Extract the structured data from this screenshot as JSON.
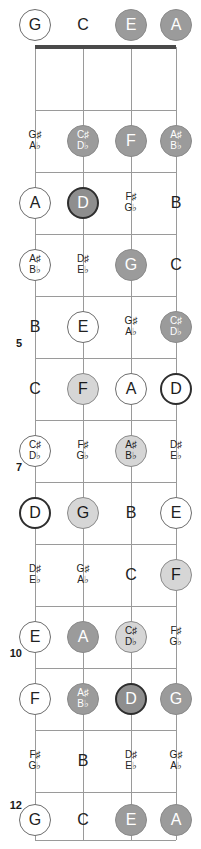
{
  "diagram": {
    "type": "fretboard",
    "instrument_strings": [
      "G",
      "C",
      "E",
      "A"
    ],
    "string_count": 4,
    "fret_count": 12,
    "string_x": [
      35,
      83,
      131,
      176
    ],
    "nut_y": 47,
    "fret_line_y": [
      47,
      110,
      172,
      234,
      296,
      358,
      420,
      482,
      544,
      606,
      668,
      730,
      792
    ],
    "open_row_y": 25,
    "note_row_y": [
      78,
      141,
      203,
      265,
      327,
      389,
      451,
      513,
      575,
      637,
      699,
      761,
      820
    ],
    "fret_numbers": [
      {
        "label": "5",
        "y": 344
      },
      {
        "label": "7",
        "y": 468
      },
      {
        "label": "10",
        "y": 654
      },
      {
        "label": "12",
        "y": 806
      }
    ],
    "notes": [
      {
        "fret": 0,
        "string": 0,
        "text": "G",
        "style": "open"
      },
      {
        "fret": 0,
        "string": 1,
        "text": "C",
        "style": "plain"
      },
      {
        "fret": 0,
        "string": 2,
        "text": "E",
        "style": "mid"
      },
      {
        "fret": 0,
        "string": 3,
        "text": "A",
        "style": "mid"
      },
      {
        "fret": 1,
        "string": 0,
        "sharp": "G♯",
        "flat": "A♭",
        "style": "plain"
      },
      {
        "fret": 1,
        "string": 1,
        "sharp": "C♯",
        "flat": "D♭",
        "style": "mid"
      },
      {
        "fret": 1,
        "string": 2,
        "text": "F",
        "style": "mid"
      },
      {
        "fret": 1,
        "string": 3,
        "sharp": "A♯",
        "flat": "B♭",
        "style": "mid"
      },
      {
        "fret": 2,
        "string": 0,
        "text": "A",
        "style": "open"
      },
      {
        "fret": 2,
        "string": 1,
        "text": "D",
        "style": "root-fill"
      },
      {
        "fret": 2,
        "string": 2,
        "sharp": "F♯",
        "flat": "G♭",
        "style": "plain"
      },
      {
        "fret": 2,
        "string": 3,
        "text": "B",
        "style": "plain"
      },
      {
        "fret": 3,
        "string": 0,
        "sharp": "A♯",
        "flat": "B♭",
        "style": "open"
      },
      {
        "fret": 3,
        "string": 1,
        "sharp": "D♯",
        "flat": "E♭",
        "style": "plain"
      },
      {
        "fret": 3,
        "string": 2,
        "text": "G",
        "style": "mid"
      },
      {
        "fret": 3,
        "string": 3,
        "text": "C",
        "style": "plain"
      },
      {
        "fret": 4,
        "string": 0,
        "text": "B",
        "style": "plain"
      },
      {
        "fret": 4,
        "string": 1,
        "text": "E",
        "style": "open"
      },
      {
        "fret": 4,
        "string": 2,
        "sharp": "G♯",
        "flat": "A♭",
        "style": "plain"
      },
      {
        "fret": 4,
        "string": 3,
        "sharp": "C♯",
        "flat": "D♭",
        "style": "mid"
      },
      {
        "fret": 5,
        "string": 0,
        "text": "C",
        "style": "plain"
      },
      {
        "fret": 5,
        "string": 1,
        "text": "F",
        "style": "light"
      },
      {
        "fret": 5,
        "string": 2,
        "text": "A",
        "style": "open"
      },
      {
        "fret": 5,
        "string": 3,
        "text": "D",
        "style": "root-hollow"
      },
      {
        "fret": 6,
        "string": 0,
        "sharp": "C♯",
        "flat": "D♭",
        "style": "open"
      },
      {
        "fret": 6,
        "string": 1,
        "sharp": "F♯",
        "flat": "G♭",
        "style": "plain"
      },
      {
        "fret": 6,
        "string": 2,
        "sharp": "A♯",
        "flat": "B♭",
        "style": "light"
      },
      {
        "fret": 6,
        "string": 3,
        "sharp": "D♯",
        "flat": "E♭",
        "style": "plain"
      },
      {
        "fret": 7,
        "string": 0,
        "text": "D",
        "style": "root-hollow"
      },
      {
        "fret": 7,
        "string": 1,
        "text": "G",
        "style": "light"
      },
      {
        "fret": 7,
        "string": 2,
        "text": "B",
        "style": "plain"
      },
      {
        "fret": 7,
        "string": 3,
        "text": "E",
        "style": "open"
      },
      {
        "fret": 8,
        "string": 0,
        "sharp": "D♯",
        "flat": "E♭",
        "style": "plain"
      },
      {
        "fret": 8,
        "string": 1,
        "sharp": "G♯",
        "flat": "A♭",
        "style": "plain"
      },
      {
        "fret": 8,
        "string": 2,
        "text": "C",
        "style": "plain"
      },
      {
        "fret": 8,
        "string": 3,
        "text": "F",
        "style": "light"
      },
      {
        "fret": 9,
        "string": 0,
        "text": "E",
        "style": "open"
      },
      {
        "fret": 9,
        "string": 1,
        "text": "A",
        "style": "mid"
      },
      {
        "fret": 9,
        "string": 2,
        "sharp": "C♯",
        "flat": "D♭",
        "style": "light"
      },
      {
        "fret": 9,
        "string": 3,
        "sharp": "F♯",
        "flat": "G♭",
        "style": "plain"
      },
      {
        "fret": 10,
        "string": 0,
        "text": "F",
        "style": "open"
      },
      {
        "fret": 10,
        "string": 1,
        "sharp": "A♯",
        "flat": "B♭",
        "style": "mid"
      },
      {
        "fret": 10,
        "string": 2,
        "text": "D",
        "style": "root-fill"
      },
      {
        "fret": 10,
        "string": 3,
        "text": "G",
        "style": "mid"
      },
      {
        "fret": 11,
        "string": 0,
        "sharp": "F♯",
        "flat": "G♭",
        "style": "plain"
      },
      {
        "fret": 11,
        "string": 1,
        "text": "B",
        "style": "plain"
      },
      {
        "fret": 11,
        "string": 2,
        "sharp": "D♯",
        "flat": "E♭",
        "style": "plain"
      },
      {
        "fret": 11,
        "string": 3,
        "sharp": "G♯",
        "flat": "A♭",
        "style": "plain"
      },
      {
        "fret": 12,
        "string": 0,
        "text": "G",
        "style": "open"
      },
      {
        "fret": 12,
        "string": 1,
        "text": "C",
        "style": "plain"
      },
      {
        "fret": 12,
        "string": 2,
        "text": "E",
        "style": "mid"
      },
      {
        "fret": 12,
        "string": 3,
        "text": "A",
        "style": "mid"
      }
    ]
  }
}
